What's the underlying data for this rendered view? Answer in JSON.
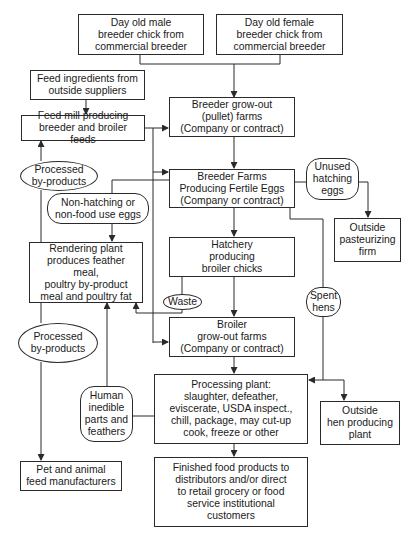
{
  "diagram": {
    "nodes": {
      "male_chick": "Day old male\nbreeder chick from\ncommercial breeder",
      "female_chick": "Day old female\nbreeder chick from\ncommercial breeder",
      "feed_ingredients": "Feed ingredients from\noutside suppliers",
      "feed_mill": "Feed mill producing\nbreeder and broiler feeds",
      "breeder_growout": "Breeder grow-out\n(pullet) farms\n(Company or contract)",
      "processed_byproducts_1": "Processed\nby-products",
      "breeder_farms": "Breeder Farms\nProducing Fertile Eggs\n(Company or contract)",
      "unused_hatching_eggs": "Unused\nhatching\neggs",
      "non_hatching_eggs": "Non-hatching or\nnon-food use eggs",
      "outside_pasteurizing": "Outside\npasteurizing\nfirm",
      "rendering_plant": "Rendering plant\nproduces feather meal,\npoultry by-product\nmeal and poultry fat",
      "hatchery": "Hatchery\nproducing\nbroiler chicks",
      "waste": "Waste",
      "spent_hens": "Spent\nhens",
      "processed_byproducts_2": "Processed\nby-products",
      "broiler_growout": "Broiler\ngrow-out farms\n(Company or contract)",
      "human_inedible": "Human\ninedible\nparts and\nfeathers",
      "processing_plant": "Processing plant:\nslaughter, defeather,\neviscerate, USDA inspect.,\nchill, package, may cut-up\ncook, freeze or other",
      "outside_hen_plant": "Outside\nhen producing\nplant",
      "pet_feed": "Pet and animal\nfeed manufacturers",
      "finished_food": "Finished food products to\ndistributors and/or direct\nto retail grocery or food\nservice institutional\ncustomers"
    },
    "edges": [
      [
        "male_chick",
        "breeder_growout"
      ],
      [
        "female_chick",
        "breeder_growout"
      ],
      [
        "feed_ingredients",
        "feed_mill"
      ],
      [
        "feed_mill",
        "breeder_growout"
      ],
      [
        "feed_mill",
        "breeder_farms"
      ],
      [
        "feed_mill",
        "broiler_growout"
      ],
      [
        "breeder_growout",
        "breeder_farms"
      ],
      [
        "breeder_farms",
        "hatchery"
      ],
      [
        "breeder_farms",
        "unused_hatching_eggs"
      ],
      [
        "unused_hatching_eggs",
        "outside_pasteurizing"
      ],
      [
        "breeder_farms",
        "non_hatching_eggs"
      ],
      [
        "non_hatching_eggs",
        "rendering_plant"
      ],
      [
        "breeder_farms",
        "spent_hens"
      ],
      [
        "spent_hens",
        "processing_plant"
      ],
      [
        "spent_hens",
        "outside_hen_plant"
      ],
      [
        "hatchery",
        "broiler_growout"
      ],
      [
        "hatchery",
        "waste"
      ],
      [
        "waste",
        "rendering_plant"
      ],
      [
        "rendering_plant",
        "processed_byproducts_1"
      ],
      [
        "processed_byproducts_1",
        "feed_mill"
      ],
      [
        "rendering_plant",
        "processed_byproducts_2"
      ],
      [
        "processed_byproducts_2",
        "pet_feed"
      ],
      [
        "broiler_growout",
        "processing_plant"
      ],
      [
        "processing_plant",
        "human_inedible"
      ],
      [
        "human_inedible",
        "rendering_plant"
      ],
      [
        "processing_plant",
        "finished_food"
      ]
    ],
    "colors": {
      "line": "#2a2a2a",
      "background": "#ffffff",
      "text": "#1a1a1a"
    }
  }
}
